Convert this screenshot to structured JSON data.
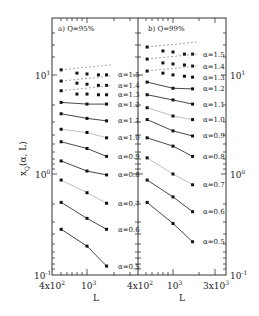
{
  "chart_data": {
    "type": "line",
    "title": "",
    "ylabel": "x_Q(α, L)",
    "xlabel": "L",
    "yscale": "log",
    "xscale": "log",
    "ylim": [
      0.1,
      30
    ],
    "grid": false,
    "panels": [
      {
        "label": "a) Q=95%",
        "xlim": [
          300,
          4000
        ],
        "xtick_labels": [
          "4x10^2",
          "10^3",
          "4x10^3"
        ],
        "ytick_labels": [
          "10^1",
          "10^0",
          "10^-1"
        ],
        "series": [
          {
            "name": "α=1.5",
            "style": "dashed-fit",
            "x": [
              400,
              700,
              1000,
              1500,
              2000
            ],
            "values": [
              11.0,
              10.2,
              10.0,
              9.8,
              9.8
            ]
          },
          {
            "name": "α=1.4",
            "style": "dashed-fit",
            "x": [
              400,
              700,
              1000,
              1500,
              2000
            ],
            "values": [
              8.5,
              8.1,
              7.9,
              7.7,
              7.7
            ]
          },
          {
            "name": "α=1.3",
            "style": "dashed-fit",
            "x": [
              400,
              700,
              1000,
              1500,
              2000
            ],
            "values": [
              6.8,
              6.3,
              6.3,
              6.2,
              6.2
            ]
          },
          {
            "name": "α=1.2",
            "style": "solid",
            "x": [
              400,
              1000,
              2000
            ],
            "values": [
              5.2,
              5.0,
              5.0
            ]
          },
          {
            "name": "α=1.1",
            "style": "solid",
            "x": [
              400,
              1000,
              2000
            ],
            "values": [
              4.0,
              3.6,
              3.4
            ]
          },
          {
            "name": "α=1.0",
            "style": "solid-grey",
            "x": [
              400,
              1000,
              2000
            ],
            "values": [
              2.8,
              2.6,
              2.3
            ]
          },
          {
            "name": "α=0.9",
            "style": "solid",
            "x": [
              400,
              1000,
              2000
            ],
            "values": [
              2.1,
              1.8,
              1.5
            ]
          },
          {
            "name": "α=0.8",
            "style": "solid",
            "x": [
              400,
              1000,
              2000
            ],
            "values": [
              1.35,
              1.07,
              0.98
            ]
          },
          {
            "name": "α=0.7",
            "style": "solid-grey",
            "x": [
              400,
              1000,
              2000
            ],
            "values": [
              0.87,
              0.65,
              0.51
            ]
          },
          {
            "name": "α=0.6",
            "style": "solid",
            "x": [
              400,
              1000,
              2000
            ],
            "values": [
              0.52,
              0.36,
              0.28
            ]
          },
          {
            "name": "α=0.5",
            "style": "solid",
            "x": [
              400,
              1000,
              2000
            ],
            "values": [
              0.28,
              0.19,
              0.12
            ]
          }
        ]
      },
      {
        "label": "b) Q=99%",
        "xlim": [
          300,
          4000
        ],
        "xtick_labels": [
          "4x10^2",
          "10^3",
          "3x10^3"
        ],
        "ytick_labels": [
          "10^1",
          "10^0",
          "10^-1"
        ],
        "series": [
          {
            "name": "α=1.5",
            "style": "dashed-fit",
            "x": [
              400,
              700,
              1000,
              1500,
              2000
            ],
            "values": [
              18.6,
              17.0,
              16.6,
              15.8,
              15.8
            ]
          },
          {
            "name": "α=1.4",
            "style": "dashed-fit",
            "x": [
              400,
              700,
              1000,
              1500,
              2000
            ],
            "values": [
              14.1,
              12.9,
              12.6,
              12.3,
              12.0
            ]
          },
          {
            "name": "α=1.3",
            "style": "dashed-fit",
            "x": [
              400,
              700,
              1000,
              1500,
              2000
            ],
            "values": [
              10.7,
              10.2,
              9.8,
              9.5,
              9.3
            ]
          },
          {
            "name": "α=1.2",
            "style": "solid",
            "x": [
              400,
              1000,
              2000
            ],
            "values": [
              8.3,
              7.2,
              7.1
            ]
          },
          {
            "name": "α=1.1",
            "style": "solid",
            "x": [
              400,
              1000,
              2000
            ],
            "values": [
              6.2,
              5.5,
              5.0
            ]
          },
          {
            "name": "α=1.0",
            "style": "solid-grey",
            "x": [
              400,
              1000,
              2000
            ],
            "values": [
              4.6,
              3.8,
              3.5
            ]
          },
          {
            "name": "α=0.9",
            "style": "solid",
            "x": [
              400,
              1000,
              2000
            ],
            "values": [
              3.5,
              2.7,
              2.4
            ]
          },
          {
            "name": "α=0.8",
            "style": "solid",
            "x": [
              400,
              1000,
              2000
            ],
            "values": [
              2.3,
              1.9,
              1.5
            ]
          },
          {
            "name": "α=0.7",
            "style": "solid-grey",
            "x": [
              400,
              1000,
              2000
            ],
            "values": [
              1.45,
              1.0,
              0.78
            ]
          },
          {
            "name": "α=0.6",
            "style": "solid",
            "x": [
              400,
              1000,
              2000
            ],
            "values": [
              0.87,
              0.59,
              0.42
            ]
          },
          {
            "name": "α=0.5",
            "style": "solid",
            "x": [
              400,
              1000,
              2000
            ],
            "values": [
              0.52,
              0.32,
              0.21
            ]
          }
        ]
      }
    ]
  },
  "labels": {
    "panel_a": "a) Q=95%",
    "panel_b": "b) Q=99%",
    "xlabel": "L",
    "ylabel_main": "x",
    "ylabel_sub": "Q",
    "ylabel_args": "(α, L)",
    "ytick_left": {
      "top_base": "10",
      "top_exp": "1",
      "mid_base": "10",
      "mid_exp": "0",
      "bot_base": "10",
      "bot_exp": "-1"
    },
    "ytick_right": {
      "top_base": "10",
      "top_exp": "1",
      "mid_base": "10",
      "mid_exp": "0",
      "bot_base": "10",
      "bot_exp": "-1"
    },
    "xtick_a": {
      "t1_base": "4x10",
      "t1_exp": "2",
      "t2_base": "10",
      "t2_exp": "3",
      "t3_base": "4x10",
      "t3_exp": "2"
    },
    "xtick_b": {
      "t2_base": "10",
      "t2_exp": "3",
      "t3_base": "3x10",
      "t3_exp": "3"
    },
    "series_labels_a": [
      "α=1.5",
      "α=1.4",
      "α=1.3",
      "α=1.2",
      "α=1.1",
      "α=1.0",
      "α=0.9",
      "α=0.8",
      "α=0.7",
      "α=0.6",
      "α=0.5"
    ],
    "series_labels_b": [
      "α=1.5",
      "α=1.4",
      "α=1.3",
      "α=1.2",
      "α=1.1",
      "α=1.0",
      "α=0.9",
      "α=0.8",
      "α=0.7",
      "α=0.6",
      "α=0.5"
    ]
  },
  "colors": {
    "line": "#333333",
    "grey_line": "#b8b8b8",
    "marker": "#111111",
    "text": "#222222",
    "grey_text": "#aaaaaa"
  }
}
